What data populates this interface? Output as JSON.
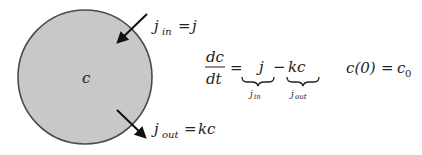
{
  "diagram": {
    "compartment": {
      "label": "c",
      "fill": "#c8c8c8",
      "stroke": "#4a4a4a"
    },
    "influx": {
      "label_j": "j",
      "label_sub": "in",
      "label_eq": "=",
      "label_rhs": "j"
    },
    "efflux": {
      "label_j": "j",
      "label_sub": "out",
      "label_eq": "=",
      "label_rhs": "kc"
    }
  },
  "equation": {
    "lhs_num": "dc",
    "lhs_den": "dt",
    "equals": "=",
    "term1": "j",
    "term1_brace_label_j": "j",
    "term1_brace_label_sub": "in",
    "minus": "−",
    "term2": "kc",
    "term2_brace_label_j": "j",
    "term2_brace_label_sub": "out",
    "initial_condition_lhs": "c(0)",
    "initial_condition_eq": "=",
    "initial_condition_rhs_base": "c",
    "initial_condition_rhs_sub": "0"
  }
}
